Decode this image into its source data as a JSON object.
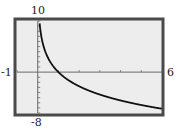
{
  "chart_data": {
    "type": "line",
    "title": "",
    "xlabel": "",
    "ylabel": "",
    "function": "y = -4 ln(x)",
    "xlim": [
      -1,
      6
    ],
    "ylim": [
      -8,
      10
    ],
    "x_tick_step": 1,
    "y_tick_step": 1,
    "grid": false,
    "series": [
      {
        "name": "curve",
        "x": [
          0.09,
          0.1,
          0.15,
          0.2,
          0.3,
          0.5,
          0.75,
          1,
          1.5,
          2,
          2.5,
          3,
          3.5,
          4,
          4.5,
          5,
          5.5,
          6
        ],
        "values": [
          9.63,
          9.21,
          7.59,
          6.44,
          4.82,
          2.77,
          1.15,
          0,
          -1.62,
          -2.77,
          -3.67,
          -4.39,
          -5.01,
          -5.55,
          -6.02,
          -6.44,
          -6.82,
          -7.17
        ]
      }
    ]
  },
  "window": {
    "xmin_label": "-1",
    "xmax_label": "6",
    "ymax_label": "10",
    "ymin_label": "-8"
  },
  "colors": {
    "frame": "#4a4a4a",
    "screen": "#ededed",
    "axis": "#6a6a6a",
    "curve": "#111111"
  }
}
